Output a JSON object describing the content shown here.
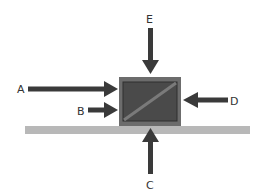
{
  "diagram": {
    "colors": {
      "arrow": "#3a3a3a",
      "crate_frame": "#6a6a6a",
      "crate_fill": "#444444",
      "ground": "#b5b5b5",
      "label": "#333333"
    },
    "arrows": [
      {
        "label": "A",
        "direction": "right"
      },
      {
        "label": "B",
        "direction": "right"
      },
      {
        "label": "C",
        "direction": "up"
      },
      {
        "label": "D",
        "direction": "left"
      },
      {
        "label": "E",
        "direction": "down"
      }
    ]
  }
}
